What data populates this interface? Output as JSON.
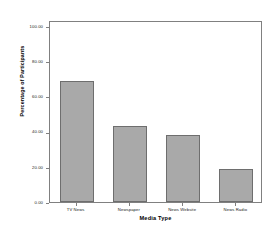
{
  "chart_data": {
    "type": "bar",
    "title": "",
    "categories": [
      "TV News",
      "Newspaper",
      "News Website",
      "News Radio"
    ],
    "values": [
      69,
      43,
      38,
      19
    ],
    "xlabel": "Media Type",
    "ylabel": "Percentage of Participants",
    "ylim": [
      0,
      100
    ],
    "yticks": [
      0,
      20,
      40,
      60,
      80,
      100
    ],
    "ytick_labels": [
      "0.00",
      "20.00",
      "40.00",
      "60.00",
      "80.00",
      "100.00"
    ],
    "grid": false,
    "legend": false,
    "bar_color": "#a9a9a9",
    "bar_border_color": "#6e6e6e",
    "frame_color": "#808080"
  }
}
